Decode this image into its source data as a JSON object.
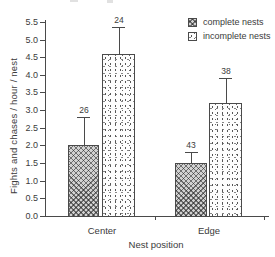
{
  "chart_data": {
    "type": "bar",
    "title": "",
    "xlabel": "Nest position",
    "ylabel": "Fights and chases / hour / nest",
    "categories": [
      "Center",
      "Edge"
    ],
    "series": [
      {
        "name": "complete nests",
        "pattern": "crosshatch",
        "values": [
          2.0,
          1.5
        ],
        "error_upper": [
          0.8,
          0.3
        ],
        "counts": [
          26,
          43
        ]
      },
      {
        "name": "incomplete nests",
        "pattern": "dots",
        "values": [
          4.6,
          3.2
        ],
        "error_upper": [
          0.75,
          0.7
        ],
        "counts": [
          24,
          38
        ]
      }
    ],
    "ylim": [
      0.0,
      5.5
    ],
    "ytick_step": 0.5,
    "ytick_labels": [
      "0.0",
      "0.5",
      "1.0",
      "1.5",
      "2.0",
      "2.5",
      "3.0",
      "3.5",
      "4.0",
      "4.5",
      "5.0",
      "5.5"
    ],
    "grid": false,
    "legend_position": "top-right",
    "error_bars": "upper-only with caps",
    "colors": {
      "background": "#ffffff",
      "axis": "#4a4a4a",
      "text": "#3b3b3b",
      "hatch_fill": "#d2d2d2",
      "dots_fill": "#fdfdfd",
      "bar_outline": "#4a4a4a"
    }
  }
}
